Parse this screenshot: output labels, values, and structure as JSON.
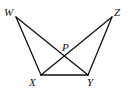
{
  "diagram": {
    "type": "geometry",
    "points": {
      "W": {
        "label": "W",
        "x": 16,
        "y": 17,
        "lx": 4,
        "ly": 16
      },
      "Z": {
        "label": "Z",
        "x": 112,
        "y": 17,
        "lx": 114,
        "ly": 16
      },
      "X": {
        "label": "X",
        "x": 41,
        "y": 75,
        "lx": 29,
        "ly": 86
      },
      "Y": {
        "label": "Y",
        "x": 88,
        "y": 75,
        "lx": 87,
        "ly": 86
      },
      "P": {
        "label": "P",
        "x": 64,
        "y": 57,
        "lx": 62,
        "ly": 51
      }
    },
    "segments": [
      [
        "W",
        "X"
      ],
      [
        "W",
        "Y"
      ],
      [
        "Z",
        "X"
      ],
      [
        "Z",
        "Y"
      ],
      [
        "X",
        "Y"
      ]
    ],
    "stroke_color": "#111111"
  }
}
